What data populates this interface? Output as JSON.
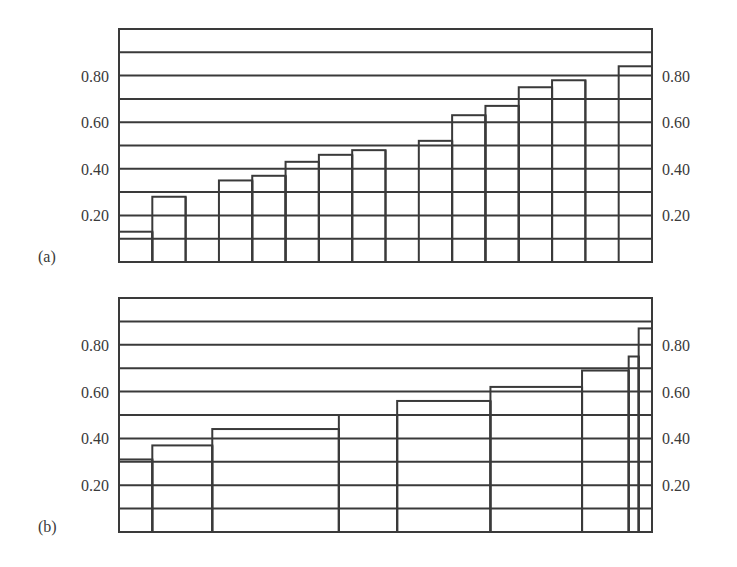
{
  "chart_data": [
    {
      "type": "bar",
      "panel_label": "(a)",
      "subtype": "step-histogram",
      "ylim": [
        0,
        1.0
      ],
      "yticks": [
        0.2,
        0.4,
        0.6,
        0.8
      ],
      "ytick_labels": [
        "0.20",
        "0.40",
        "0.60",
        "0.80"
      ],
      "gridlines": [
        0.1,
        0.2,
        0.3,
        0.4,
        0.5,
        0.6,
        0.7,
        0.8,
        0.9
      ],
      "grid": true,
      "ylabels_both_sides": true,
      "bins": [
        {
          "x0": 0,
          "x1": 1,
          "value": 0.13
        },
        {
          "x0": 1,
          "x1": 2,
          "value": 0.28
        },
        {
          "x0": 2,
          "x1": 3,
          "value": null
        },
        {
          "x0": 3,
          "x1": 4,
          "value": 0.35
        },
        {
          "x0": 4,
          "x1": 5,
          "value": 0.37
        },
        {
          "x0": 5,
          "x1": 6,
          "value": 0.43
        },
        {
          "x0": 6,
          "x1": 7,
          "value": 0.46
        },
        {
          "x0": 7,
          "x1": 8,
          "value": 0.48
        },
        {
          "x0": 8,
          "x1": 9,
          "value": null
        },
        {
          "x0": 9,
          "x1": 10,
          "value": 0.52
        },
        {
          "x0": 10,
          "x1": 11,
          "value": 0.63
        },
        {
          "x0": 11,
          "x1": 12,
          "value": 0.67
        },
        {
          "x0": 12,
          "x1": 13,
          "value": 0.75
        },
        {
          "x0": 13,
          "x1": 14,
          "value": 0.78
        },
        {
          "x0": 14,
          "x1": 15,
          "value": null
        },
        {
          "x0": 15,
          "x1": 16,
          "value": 0.84
        }
      ],
      "xlim": [
        0,
        16
      ]
    },
    {
      "type": "bar",
      "panel_label": "(b)",
      "subtype": "step-histogram",
      "ylim": [
        0,
        1.0
      ],
      "yticks": [
        0.2,
        0.4,
        0.6,
        0.8
      ],
      "ytick_labels": [
        "0.20",
        "0.40",
        "0.60",
        "0.80"
      ],
      "gridlines": [
        0.1,
        0.2,
        0.3,
        0.4,
        0.5,
        0.6,
        0.7,
        0.8,
        0.9
      ],
      "grid": true,
      "ylabels_both_sides": true,
      "bins": [
        {
          "x0": 0,
          "x1": 1.0,
          "value": 0.31
        },
        {
          "x0": 1.0,
          "x1": 2.8,
          "value": 0.37
        },
        {
          "x0": 2.8,
          "x1": 6.6,
          "value": 0.44
        },
        {
          "x0": 6.6,
          "x1": 8.35,
          "value": 0.5
        },
        {
          "x0": 8.35,
          "x1": 11.15,
          "value": 0.56
        },
        {
          "x0": 11.15,
          "x1": 13.9,
          "value": 0.62
        },
        {
          "x0": 13.9,
          "x1": 15.3,
          "value": 0.69
        },
        {
          "x0": 15.3,
          "x1": 15.6,
          "value": 0.75
        },
        {
          "x0": 15.6,
          "x1": 16.0,
          "value": 0.87
        }
      ],
      "xlim": [
        0,
        16
      ]
    }
  ],
  "panels": {
    "a": {
      "label": "(a)"
    },
    "b": {
      "label": "(b)"
    }
  },
  "colors": {
    "line": "#3a3a3a",
    "text": "#3a3a3a",
    "background": "#ffffff"
  }
}
